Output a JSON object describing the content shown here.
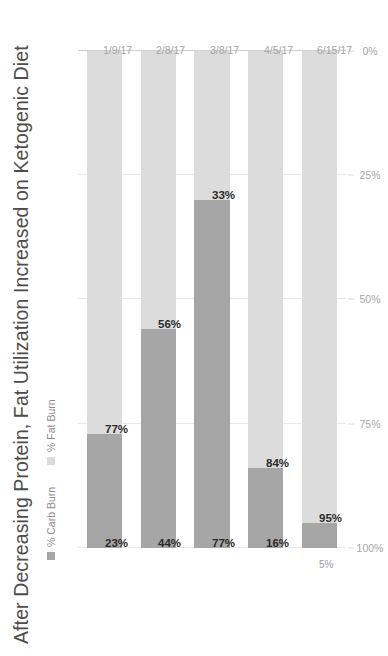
{
  "chart_data": {
    "type": "bar",
    "subtype": "stacked-horizontal-bar",
    "title": "After Decreasing Protein, Fat Utilization Increased on Ketogenic Diet",
    "xlabel": "",
    "ylabel": "",
    "xlim": [
      0,
      100
    ],
    "grid": true,
    "legend_position": "top-left",
    "orientation": "rotated-90ccw",
    "categories": [
      "1/9/17",
      "2/8/17",
      "3/8/17",
      "4/5/17",
      "6/15/17"
    ],
    "xticks": [
      "0%",
      "25%",
      "50%",
      "75%",
      "100%"
    ],
    "xtick_values": [
      0,
      25,
      50,
      75,
      100
    ],
    "series": [
      {
        "name": "% Carb Burn",
        "color": "#a6a6a6",
        "values": [
          23,
          44,
          77,
          16,
          5
        ],
        "labels": [
          "23%",
          "44%",
          "77%",
          "16%",
          "5%"
        ],
        "label_outside": [
          false,
          false,
          false,
          false,
          true
        ]
      },
      {
        "name": "% Fat Burn",
        "color": "#dcdcdc",
        "values": [
          77,
          56,
          33,
          84,
          95
        ],
        "labels": [
          "77%",
          "56%",
          "33%",
          "84%",
          "95%"
        ],
        "label_outside": [
          false,
          false,
          false,
          false,
          false
        ]
      }
    ],
    "bars": [
      {
        "category": "1/9/17",
        "carb_burn": 23,
        "carb_burn_label": "23%",
        "fat_burn": 77,
        "fat_burn_label": "77%"
      },
      {
        "category": "2/8/17",
        "carb_burn": 44,
        "carb_burn_label": "44%",
        "fat_burn": 56,
        "fat_burn_label": "56%"
      },
      {
        "category": "3/8/17",
        "carb_burn": 77,
        "carb_burn_label": "77%",
        "fat_burn": 33,
        "fat_burn_label": "33%"
      },
      {
        "category": "4/5/17",
        "carb_burn": 16,
        "carb_burn_label": "16%",
        "fat_burn": 84,
        "fat_burn_label": "84%"
      },
      {
        "category": "6/15/17",
        "carb_burn": 5,
        "carb_burn_label": "5%",
        "fat_burn": 95,
        "fat_burn_label": "95%"
      }
    ]
  },
  "colors": {
    "carb_burn": "#a6a6a6",
    "fat_burn": "#dcdcdc",
    "gridline": "#e8e8e8",
    "axis_text": "#a6a6a6",
    "title_text": "#4d4d4d",
    "legend_text": "#8c8c8c",
    "data_label": "#2b2b2b",
    "background": "#ffffff"
  }
}
